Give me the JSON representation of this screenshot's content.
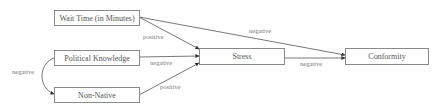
{
  "diagram": {
    "type": "path-model",
    "nodes": [
      {
        "id": "wait_time",
        "label": "Wait Time (in Minutes)"
      },
      {
        "id": "political_knowledge",
        "label": "Political Knowledge"
      },
      {
        "id": "non_native",
        "label": "Non-Native"
      },
      {
        "id": "stress",
        "label": "Stress"
      },
      {
        "id": "conformity",
        "label": "Conformity"
      }
    ],
    "edges": [
      {
        "from": "wait_time",
        "to": "stress",
        "label": "positive"
      },
      {
        "from": "political_knowledge",
        "to": "stress",
        "label": "negative"
      },
      {
        "from": "non_native",
        "to": "stress",
        "label": "positive"
      },
      {
        "from": "wait_time",
        "to": "conformity",
        "label": "negative"
      },
      {
        "from": "stress",
        "to": "conformity",
        "label": "negative"
      },
      {
        "from": "political_knowledge",
        "to": "non_native",
        "label": "negative",
        "bidirectional": true
      }
    ],
    "colors": {
      "line": "#555555",
      "border": "#8a8a8a",
      "text": "#555555"
    }
  }
}
